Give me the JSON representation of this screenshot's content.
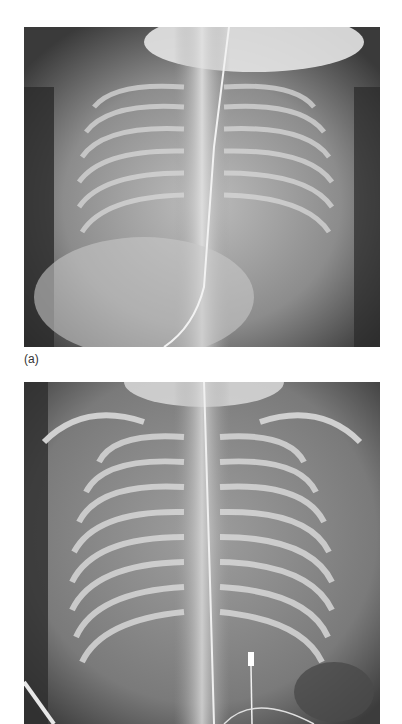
{
  "figure": {
    "panels": [
      {
        "label": "(a)",
        "image_description": "Neonatal frontal chest radiograph with endotracheal tube and umbilical venous catheter; diffuse hazy lung opacity",
        "icon": "xray-image"
      },
      {
        "label": "",
        "image_description": "Neonatal frontal chest radiograph with endotracheal tube, catheter and clip at left lower chest; hyperexpanded lungs with ribs visible",
        "icon": "xray-image"
      }
    ],
    "colors": {
      "background": "#ffffff",
      "label_text": "#333333",
      "xray_dark": "#2a2a2a",
      "xray_mid": "#7a7a7a",
      "xray_light": "#e6e6e6"
    }
  }
}
